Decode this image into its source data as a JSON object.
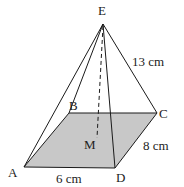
{
  "diagram": {
    "type": "rectangular pyramid",
    "vertices": {
      "A": {
        "label": "A",
        "x": 24,
        "y": 167
      },
      "B": {
        "label": "B",
        "x": 69,
        "y": 113
      },
      "C": {
        "label": "C",
        "x": 157,
        "y": 113
      },
      "D": {
        "label": "D",
        "x": 115,
        "y": 168
      },
      "E": {
        "label": "E",
        "x": 103,
        "y": 24
      },
      "M": {
        "label": "M",
        "x": 97,
        "y": 138
      }
    },
    "measurements": {
      "ec": "13 cm",
      "dc": "8 cm",
      "ad": "6 cm"
    },
    "colors": {
      "base_fill": "#c8c8c8",
      "stroke": "#1a1a1a"
    }
  }
}
